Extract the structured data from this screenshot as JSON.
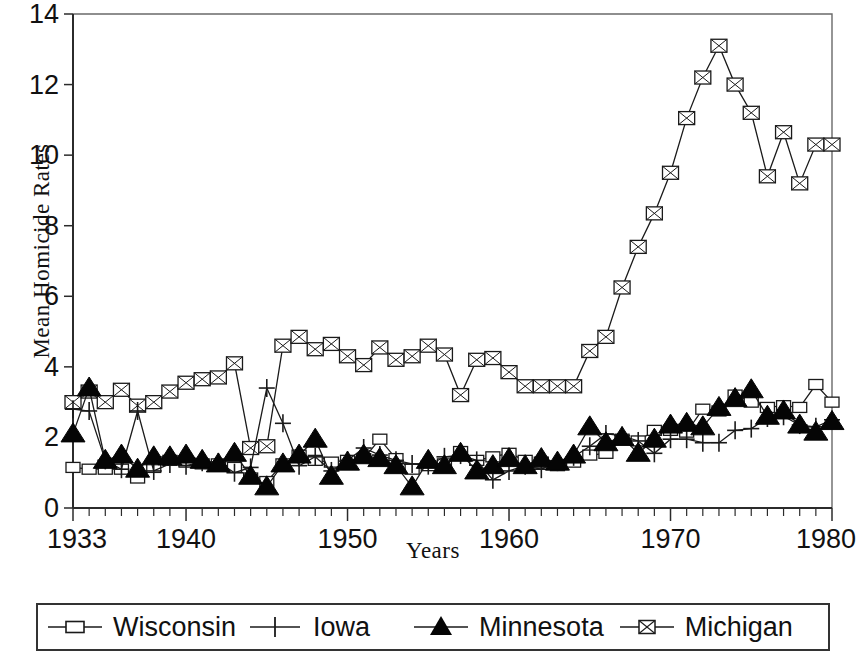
{
  "chart_data": {
    "type": "line",
    "title": "",
    "xlabel": "Years",
    "ylabel": "Mean Homicide Rates",
    "xlim": [
      1933,
      1980
    ],
    "ylim": [
      0,
      14
    ],
    "ytick_labels": [
      "0",
      "2",
      "4",
      "6",
      "8",
      "10",
      "12",
      "14"
    ],
    "yticks": [
      0,
      2,
      4,
      6,
      8,
      10,
      12,
      14
    ],
    "xtick_labels": [
      "1933",
      "1940",
      "1950",
      "1960",
      "1970",
      "1980"
    ],
    "xticks": [
      1933,
      1940,
      1950,
      1960,
      1970,
      1980
    ],
    "minor_xtick_interval": 1,
    "grid": false,
    "legend_position": "below-axes",
    "x": [
      1933,
      1934,
      1935,
      1936,
      1937,
      1938,
      1939,
      1940,
      1941,
      1942,
      1943,
      1944,
      1945,
      1946,
      1947,
      1948,
      1949,
      1950,
      1951,
      1952,
      1953,
      1954,
      1955,
      1956,
      1957,
      1958,
      1959,
      1960,
      1961,
      1962,
      1963,
      1964,
      1965,
      1966,
      1967,
      1968,
      1969,
      1970,
      1971,
      1972,
      1973,
      1974,
      1975,
      1976,
      1977,
      1978,
      1979,
      1980
    ],
    "series": [
      {
        "name": "Wisconsin",
        "marker": "open-square",
        "values": [
          1.15,
          1.1,
          1.1,
          1.1,
          0.85,
          1.15,
          1.35,
          1.3,
          1.25,
          1.25,
          1.15,
          0.85,
          0.75,
          1.25,
          1.5,
          1.35,
          1.3,
          1.35,
          1.4,
          1.95,
          1.4,
          1.1,
          1.2,
          1.25,
          1.6,
          1.35,
          1.45,
          1.55,
          1.35,
          1.3,
          1.2,
          1.3,
          1.5,
          1.55,
          1.95,
          1.9,
          2.2,
          2.2,
          2.15,
          2.8,
          2.75,
          3.2,
          3.0,
          2.85,
          2.9,
          2.85,
          3.5,
          3.0
        ]
      },
      {
        "name": "Iowa",
        "marker": "plus",
        "values": [
          2.8,
          2.75,
          1.35,
          1.1,
          2.75,
          1.05,
          1.25,
          1.2,
          1.3,
          1.3,
          1.0,
          1.15,
          3.4,
          2.4,
          1.2,
          1.45,
          1.05,
          1.35,
          1.7,
          1.5,
          1.35,
          1.25,
          1.2,
          1.45,
          1.5,
          1.35,
          0.8,
          1.05,
          1.2,
          1.1,
          1.3,
          1.45,
          1.75,
          2.1,
          2.05,
          1.9,
          1.55,
          1.95,
          1.95,
          1.85,
          1.85,
          2.2,
          2.25,
          2.55,
          2.6,
          2.35,
          2.3,
          2.5
        ]
      },
      {
        "name": "Minnesota",
        "marker": "filled-triangle",
        "values": [
          2.1,
          3.4,
          1.35,
          1.5,
          1.1,
          1.45,
          1.45,
          1.5,
          1.35,
          1.25,
          1.55,
          0.9,
          0.6,
          1.25,
          1.5,
          1.95,
          0.9,
          1.3,
          1.5,
          1.4,
          1.2,
          0.6,
          1.35,
          1.2,
          1.55,
          1.05,
          1.2,
          1.4,
          1.2,
          1.4,
          1.3,
          1.5,
          2.3,
          1.85,
          2.0,
          1.55,
          1.95,
          2.35,
          2.4,
          2.3,
          2.85,
          3.1,
          3.35,
          2.6,
          2.75,
          2.35,
          2.15,
          2.45
        ]
      },
      {
        "name": "Michigan",
        "marker": "crossed-square",
        "values": [
          3.0,
          3.3,
          3.0,
          3.35,
          2.9,
          3.0,
          3.3,
          3.55,
          3.65,
          3.7,
          4.1,
          1.7,
          1.75,
          4.6,
          4.85,
          4.5,
          4.65,
          4.3,
          4.05,
          4.55,
          4.2,
          4.3,
          4.6,
          4.35,
          3.2,
          4.2,
          4.25,
          3.85,
          3.45,
          3.45,
          3.45,
          3.45,
          4.45,
          4.85,
          6.25,
          7.4,
          8.35,
          9.5,
          11.05,
          12.2,
          13.1,
          12.0,
          11.2,
          9.4,
          10.65,
          9.2,
          10.3,
          10.3
        ]
      }
    ]
  },
  "axes": {
    "y_title": "Mean Homicide Rates",
    "x_title": "Years"
  },
  "legend": {
    "items": [
      {
        "label": "Wisconsin",
        "marker": "open-square"
      },
      {
        "label": "Iowa",
        "marker": "plus"
      },
      {
        "label": "Minnesota",
        "marker": "filled-triangle"
      },
      {
        "label": "Michigan",
        "marker": "crossed-square"
      }
    ]
  }
}
